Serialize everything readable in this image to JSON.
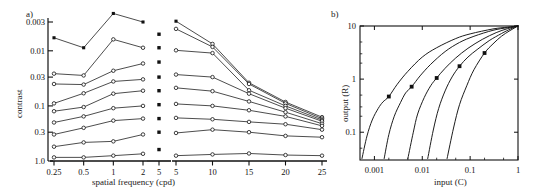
{
  "figure": {
    "width": 536,
    "height": 194,
    "background": "#ffffff",
    "ink": "#111111"
  },
  "panel_a": {
    "tag": "a)",
    "xlabel": "spatial frequency (cpd)",
    "ylabel": "contrast",
    "x_ticks_left": [
      "0.25",
      "0.5",
      "1",
      "2"
    ],
    "x_ticks_mid": [
      "5"
    ],
    "x_ticks_right": [
      "5",
      "10",
      "15",
      "20",
      "25"
    ],
    "y_ticks": [
      "0.003",
      "0.01",
      "0.03",
      "0.1",
      "0.3",
      "1.0"
    ]
  },
  "panel_b": {
    "tag": "b)",
    "xlabel": "input (C)",
    "ylabel": "output (R)",
    "x_ticks": [
      "0.001",
      "0.01",
      "0.1",
      "1"
    ],
    "y_ticks": [
      "10",
      "1",
      "0.1"
    ]
  },
  "chart_data": [
    {
      "type": "line",
      "title": "",
      "panel": "a",
      "xlabel": "spatial frequency (cpd)",
      "ylabel": "contrast",
      "xscale_left": "log",
      "xscale_right": "linear",
      "yscale": "log",
      "y_inverted": true,
      "ylim": [
        0.003,
        1.0
      ],
      "y_ticks": [
        0.003,
        0.01,
        0.03,
        0.1,
        0.3,
        1.0
      ],
      "x_left": [
        0.25,
        0.5,
        1,
        2
      ],
      "x_mid": [
        5
      ],
      "x_right": [
        5,
        10,
        15,
        20,
        25
      ],
      "x_ticks_left": [
        0.25,
        0.5,
        1,
        2
      ],
      "x_ticks_right": [
        5,
        10,
        15,
        20,
        25
      ],
      "grid": false,
      "legend": "none",
      "marker_open": "circle",
      "marker_filled": "square",
      "series": [
        {
          "name": "level-1",
          "marker": "filled",
          "left": [
            0.0058,
            0.0088,
            0.0021,
            0.003
          ],
          "mid": [
            0.005
          ],
          "mid_y": 0.005,
          "right": [
            0.0029,
            0.0075,
            0.038,
            0.085,
            0.16
          ]
        },
        {
          "name": "level-2",
          "marker": "open",
          "left": [
            0.026,
            0.028,
            0.0062,
            0.0088
          ],
          "mid": [
            0.0088
          ],
          "mid_y": 0.0088,
          "right": [
            0.004,
            0.0085,
            0.04,
            0.09,
            0.17
          ]
        },
        {
          "name": "level-3",
          "marker": "open",
          "left": [
            0.04,
            0.041,
            0.023,
            0.017
          ],
          "mid": [
            0.016
          ],
          "mid_y": 0.016,
          "right": [
            0.0098,
            0.011,
            0.052,
            0.1,
            0.18
          ]
        },
        {
          "name": "level-4",
          "marker": "open",
          "left": [
            0.09,
            0.059,
            0.036,
            0.033
          ],
          "mid": [
            0.03
          ],
          "mid_y": 0.03,
          "right": [
            0.027,
            0.03,
            0.06,
            0.11,
            0.19
          ]
        },
        {
          "name": "level-5",
          "marker": "open",
          "left": [
            0.125,
            0.105,
            0.06,
            0.053
          ],
          "mid": [
            0.053
          ],
          "mid_y": 0.053,
          "right": [
            0.047,
            0.054,
            0.083,
            0.13,
            0.21
          ]
        },
        {
          "name": "level-6",
          "marker": "open",
          "left": [
            0.2,
            0.155,
            0.11,
            0.1
          ],
          "mid": [
            0.095
          ],
          "mid_y": 0.095,
          "right": [
            0.092,
            0.1,
            0.12,
            0.155,
            0.23
          ]
        },
        {
          "name": "level-7",
          "marker": "open",
          "left": [
            0.33,
            0.25,
            0.185,
            0.17
          ],
          "mid": [
            0.17
          ],
          "mid_y": 0.17,
          "right": [
            0.165,
            0.175,
            0.195,
            0.215,
            0.27
          ]
        },
        {
          "name": "level-8",
          "marker": "open",
          "left": [
            0.55,
            0.46,
            0.44,
            0.33
          ],
          "mid": [
            0.3
          ],
          "mid_y": 0.3,
          "right": [
            0.31,
            0.27,
            0.3,
            0.35,
            0.37
          ]
        },
        {
          "name": "level-9",
          "marker": "open",
          "left": [
            0.86,
            0.86,
            0.8,
            0.74
          ],
          "mid": [
            0.62
          ],
          "mid_y": 0.62,
          "right": [
            0.8,
            0.76,
            0.73,
            0.78,
            0.8
          ]
        }
      ]
    },
    {
      "type": "line",
      "panel": "b",
      "title": "",
      "xlabel": "input (C)",
      "ylabel": "output (R)",
      "xscale": "log",
      "yscale": "log",
      "xlim": [
        0.0005,
        1.0
      ],
      "ylim": [
        0.03,
        10.0
      ],
      "x_ticks": [
        0.001,
        0.01,
        0.1,
        1
      ],
      "y_ticks": [
        0.1,
        1,
        10
      ],
      "grid": false,
      "legend": "none",
      "marker": "filled-square",
      "series": [
        {
          "name": "c50-0.002",
          "c50": 0.002,
          "marker_point": [
            0.002,
            0.47
          ],
          "points": [
            [
              0.00055,
              0.032
            ],
            [
              0.0007,
              0.085
            ],
            [
              0.0009,
              0.17
            ],
            [
              0.0012,
              0.28
            ],
            [
              0.0015,
              0.37
            ],
            [
              0.002,
              0.47
            ],
            [
              0.003,
              0.8
            ],
            [
              0.005,
              1.4
            ],
            [
              0.01,
              2.6
            ],
            [
              0.02,
              3.9
            ],
            [
              0.05,
              5.8
            ],
            [
              0.1,
              7.1
            ],
            [
              0.3,
              8.8
            ],
            [
              0.6,
              9.5
            ],
            [
              1.0,
              10.0
            ]
          ]
        },
        {
          "name": "c50-0.006",
          "c50": 0.006,
          "marker_point": [
            0.006,
            0.72
          ],
          "points": [
            [
              0.0016,
              0.032
            ],
            [
              0.002,
              0.09
            ],
            [
              0.0026,
              0.2
            ],
            [
              0.0035,
              0.36
            ],
            [
              0.0045,
              0.55
            ],
            [
              0.006,
              0.72
            ],
            [
              0.009,
              1.15
            ],
            [
              0.015,
              1.9
            ],
            [
              0.03,
              3.3
            ],
            [
              0.06,
              4.9
            ],
            [
              0.12,
              6.4
            ],
            [
              0.3,
              8.3
            ],
            [
              0.6,
              9.3
            ],
            [
              1.0,
              10.0
            ]
          ]
        },
        {
          "name": "c50-0.02",
          "c50": 0.02,
          "marker_point": [
            0.02,
            1.05
          ],
          "points": [
            [
              0.005,
              0.032
            ],
            [
              0.0065,
              0.1
            ],
            [
              0.008,
              0.22
            ],
            [
              0.011,
              0.45
            ],
            [
              0.015,
              0.75
            ],
            [
              0.02,
              1.05
            ],
            [
              0.03,
              1.6
            ],
            [
              0.05,
              2.5
            ],
            [
              0.09,
              3.8
            ],
            [
              0.18,
              5.6
            ],
            [
              0.35,
              7.5
            ],
            [
              0.6,
              8.9
            ],
            [
              1.0,
              10.0
            ]
          ]
        },
        {
          "name": "c50-0.06",
          "c50": 0.06,
          "marker_point": [
            0.06,
            1.75
          ],
          "points": [
            [
              0.013,
              0.032
            ],
            [
              0.017,
              0.11
            ],
            [
              0.022,
              0.28
            ],
            [
              0.03,
              0.6
            ],
            [
              0.042,
              1.1
            ],
            [
              0.06,
              1.75
            ],
            [
              0.09,
              2.6
            ],
            [
              0.14,
              3.6
            ],
            [
              0.25,
              5.3
            ],
            [
              0.45,
              7.2
            ],
            [
              0.7,
              8.8
            ],
            [
              1.0,
              10.0
            ]
          ]
        },
        {
          "name": "c50-0.2",
          "c50": 0.2,
          "marker_point": [
            0.2,
            3.1
          ],
          "points": [
            [
              0.033,
              0.032
            ],
            [
              0.045,
              0.12
            ],
            [
              0.06,
              0.33
            ],
            [
              0.085,
              0.75
            ],
            [
              0.12,
              1.5
            ],
            [
              0.2,
              3.1
            ],
            [
              0.3,
              4.6
            ],
            [
              0.45,
              6.4
            ],
            [
              0.65,
              8.0
            ],
            [
              0.85,
              9.2
            ],
            [
              1.0,
              10.0
            ]
          ]
        }
      ]
    }
  ]
}
